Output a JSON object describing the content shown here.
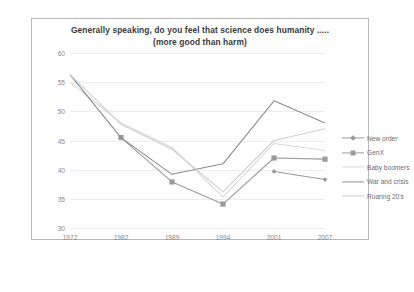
{
  "chart_data": {
    "type": "line",
    "title": "Generally speaking, do you feel that science does humanity  .....\n(more good than harm)",
    "title_line1": "Generally speaking, do you feel that science does humanity  .....",
    "title_line2": "(more good than harm)",
    "xlabel": "",
    "ylabel": "",
    "categories": [
      "1972",
      "1982",
      "1989",
      "1994",
      "2001",
      "2007"
    ],
    "ylim": [
      30,
      60
    ],
    "yticks": [
      "30",
      "35",
      "40",
      "45",
      "50",
      "55",
      "60"
    ],
    "grid": true,
    "legend_position": "right",
    "series": [
      {
        "name": "New order",
        "color": "#9a9a9a",
        "marker": "diamond",
        "values": [
          null,
          null,
          null,
          null,
          39.7,
          38.3
        ]
      },
      {
        "name": "GenX",
        "color": "#9b9b9b",
        "marker": "square",
        "values": [
          null,
          45.5,
          37.9,
          34.1,
          42.0,
          41.8
        ]
      },
      {
        "name": "Baby boomers",
        "color": "#d9d9d9",
        "marker": "none",
        "values": [
          55.0,
          48.0,
          43.8,
          35.3,
          44.5,
          43.3
        ]
      },
      {
        "name": "War and crisis",
        "color": "#8d8d8d",
        "marker": "none",
        "values": [
          56.3,
          45.5,
          39.2,
          41.0,
          51.8,
          48.0
        ]
      },
      {
        "name": "Roaring 20's",
        "color": "#cfcfcf",
        "marker": "none",
        "values": [
          56.3,
          47.8,
          43.5,
          36.2,
          45.0,
          47.0
        ]
      }
    ]
  }
}
